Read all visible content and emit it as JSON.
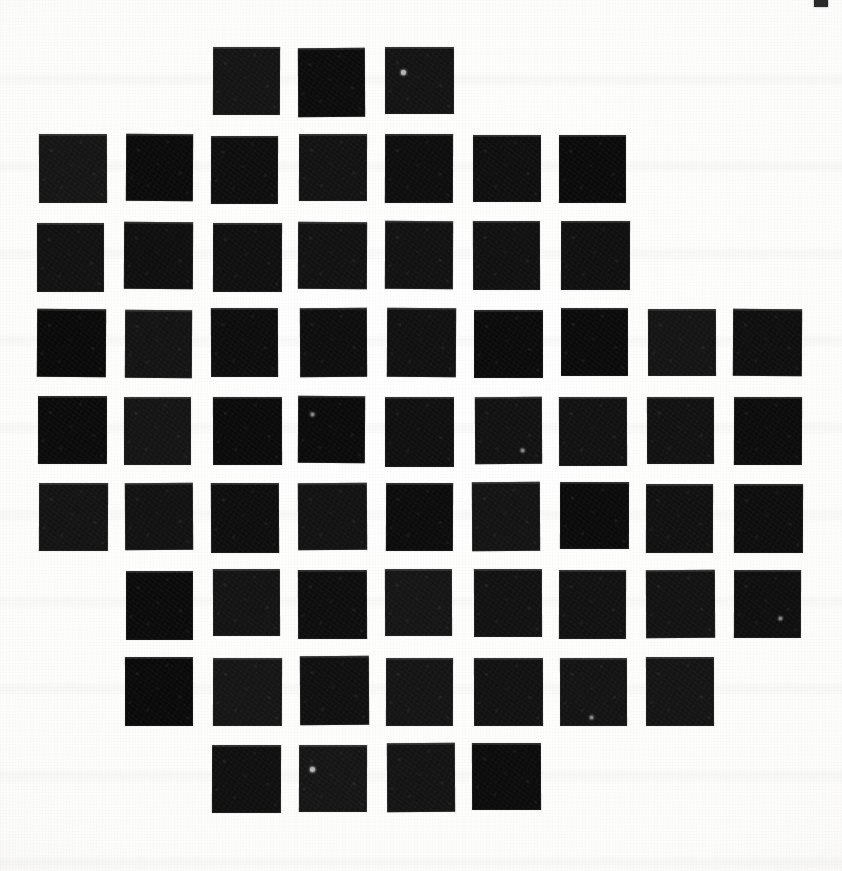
{
  "page": {
    "medium": "scanned paper",
    "width": 842,
    "height": 871,
    "background_color": "#ffffff",
    "paper_tone": "#fdfdfc",
    "ink_color": "#151515"
  },
  "lattice": {
    "description": "Grid of solid black squares arranged in a rounded, roughly circular silhouette on a white page.",
    "rows": 9,
    "columns": 9,
    "tile_count": 63,
    "tile_width": 68,
    "tile_height": 68,
    "pitch_x": 87,
    "pitch_y": 87,
    "origin_x": 38,
    "origin_y": 48,
    "shape": "octagonal-disc",
    "row_occupancy": [
      {
        "row": 0,
        "count": 3,
        "columns": [
          2,
          3,
          4
        ]
      },
      {
        "row": 1,
        "count": 7,
        "columns": [
          0,
          1,
          2,
          3,
          4,
          5,
          6
        ]
      },
      {
        "row": 2,
        "count": 7,
        "columns": [
          0,
          1,
          2,
          3,
          4,
          5,
          6
        ]
      },
      {
        "row": 3,
        "count": 9,
        "columns": [
          0,
          1,
          2,
          3,
          4,
          5,
          6,
          7,
          8
        ]
      },
      {
        "row": 4,
        "count": 9,
        "columns": [
          0,
          1,
          2,
          3,
          4,
          5,
          6,
          7,
          8
        ]
      },
      {
        "row": 5,
        "count": 9,
        "columns": [
          0,
          1,
          2,
          3,
          4,
          5,
          6,
          7,
          8
        ]
      },
      {
        "row": 6,
        "count": 8,
        "columns": [
          1,
          2,
          3,
          4,
          5,
          6,
          7,
          8
        ]
      },
      {
        "row": 7,
        "count": 7,
        "columns": [
          1,
          2,
          3,
          4,
          5,
          6,
          7
        ]
      },
      {
        "row": 8,
        "count": 4,
        "columns": [
          2,
          3,
          4,
          5
        ]
      }
    ]
  },
  "blemishes": [
    {
      "name": "speck-r0c4",
      "row": 0,
      "column": 4,
      "offset_x": 16,
      "offset_y": 23,
      "size": 5,
      "color": "#b9b8b4"
    },
    {
      "name": "speck-r8c3",
      "row": 8,
      "column": 3,
      "offset_x": 11,
      "offset_y": 22,
      "size": 5,
      "color": "#b9b8b4"
    },
    {
      "name": "speck-r4c3",
      "row": 4,
      "column": 3,
      "offset_x": 13,
      "offset_y": 17,
      "size": 3,
      "color": "#8e8d8a"
    },
    {
      "name": "speck-r4c5",
      "row": 4,
      "column": 5,
      "offset_x": 46,
      "offset_y": 52,
      "size": 3,
      "color": "#8e8d8a"
    },
    {
      "name": "speck-r6c8",
      "row": 6,
      "column": 8,
      "offset_x": 45,
      "offset_y": 47,
      "size": 3,
      "color": "#8e8d8a"
    },
    {
      "name": "speck-r7c6",
      "row": 7,
      "column": 6,
      "offset_x": 30,
      "offset_y": 58,
      "size": 3,
      "color": "#8e8d8a"
    }
  ],
  "edge_artifact": {
    "name": "scanner-edge-mark",
    "x": 814,
    "y": 0,
    "width": 14,
    "height": 7,
    "color": "#2a2a2a"
  }
}
